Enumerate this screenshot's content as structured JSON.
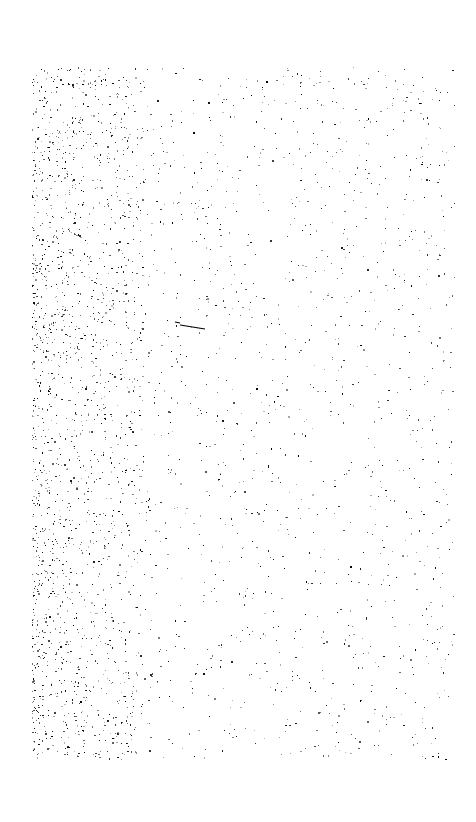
{
  "page": {
    "background": "#ffffff",
    "content": "scanned blank page with speckle noise",
    "text": ""
  },
  "speckle": {
    "region": {
      "x": 32,
      "y": 67,
      "width": 423,
      "height": 693
    },
    "ink_color": "#000000",
    "seed": 1337,
    "count_dense_left": 1400,
    "dense_left_width": 70,
    "count_uniform": 1700,
    "strokes": [
      {
        "x1": 180,
        "y1": 325,
        "x2": 205,
        "y2": 329
      },
      {
        "x1": 175,
        "y1": 322,
        "x2": 180,
        "y2": 323
      }
    ]
  }
}
